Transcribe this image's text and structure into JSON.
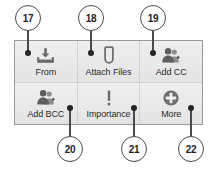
{
  "panel": {
    "name": "email-compose-toolbar",
    "background_color": "#e9e9e9",
    "border_color": "#9a9a9a",
    "rows": [
      {
        "cells": [
          {
            "label": "From",
            "icon": "inbox-download-icon"
          },
          {
            "label": "Attach Files",
            "icon": "paperclip-icon"
          },
          {
            "label": "Add CC",
            "icon": "people-add-icon"
          }
        ]
      },
      {
        "cells": [
          {
            "label": "Add BCC",
            "icon": "people-add-icon"
          },
          {
            "label": "Importance",
            "icon": "exclamation-icon"
          },
          {
            "label": "More",
            "icon": "plus-circle-icon"
          }
        ]
      }
    ]
  },
  "callouts": [
    {
      "number": "17",
      "target": "From"
    },
    {
      "number": "18",
      "target": "Attach Files"
    },
    {
      "number": "19",
      "target": "Add CC"
    },
    {
      "number": "20",
      "target": "Add BCC"
    },
    {
      "number": "21",
      "target": "Importance"
    },
    {
      "number": "22",
      "target": "More"
    }
  ],
  "colors": {
    "callout_stroke": "#4a4a4a",
    "dot_fill": "#262626",
    "icon_gray": "#6a6a6a",
    "label_text": "#2b2b2b"
  }
}
